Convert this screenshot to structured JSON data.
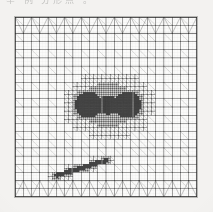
{
  "page": {
    "background_color": "#f3f2f0",
    "scan_artifact_text": "举 例    分形点 。"
  },
  "figure": {
    "name": "adaptive-mesh-figure",
    "frame_color": "#b9b9b6",
    "paper_color": "#fbfbfa",
    "ink_color": "#2b2b2b",
    "bounds": {
      "x": 14,
      "y": 16,
      "width": 184,
      "height": 182
    }
  },
  "chart_data": {
    "type": "mesh",
    "title": "",
    "subtitle": "",
    "xlabel": "",
    "ylabel": "",
    "grid": true,
    "legend": null,
    "domain": {
      "x0": 0,
      "x1": 1,
      "y0": 0,
      "y1": 1
    },
    "base_grid": {
      "nx": 22,
      "ny": 22,
      "cell_shape": "quad-split-into-triangles"
    },
    "border_band": {
      "present_on": [
        "top",
        "bottom"
      ],
      "pattern": "zigzag-triangle-strip",
      "thickness_cells": 2
    },
    "refinement_levels": [
      0,
      1,
      2,
      3,
      4,
      5
    ],
    "refinement_features": [
      {
        "name": "left-singularity",
        "shape": "circle",
        "cx": 0.405,
        "cy": 0.49,
        "r": 0.115,
        "max_level": 5,
        "ink_density": 0.92
      },
      {
        "name": "right-singularity",
        "shape": "circle",
        "cx": 0.62,
        "cy": 0.49,
        "r": 0.115,
        "max_level": 5,
        "ink_density": 0.92
      },
      {
        "name": "centre-bridge",
        "shape": "circle",
        "cx": 0.512,
        "cy": 0.49,
        "r": 0.055,
        "max_level": 3,
        "ink_density": 0.45
      },
      {
        "name": "outer-halo",
        "shape": "ellipse",
        "cx": 0.512,
        "cy": 0.49,
        "rx": 0.3,
        "ry": 0.23,
        "max_level": 2,
        "ink_density": 0.3
      },
      {
        "name": "oblique-band",
        "shape": "band",
        "x0": 0.17,
        "y0": 0.9,
        "x1": 0.56,
        "y1": 0.78,
        "half_width": 0.035,
        "max_level": 4,
        "ink_density": 0.8
      }
    ]
  }
}
